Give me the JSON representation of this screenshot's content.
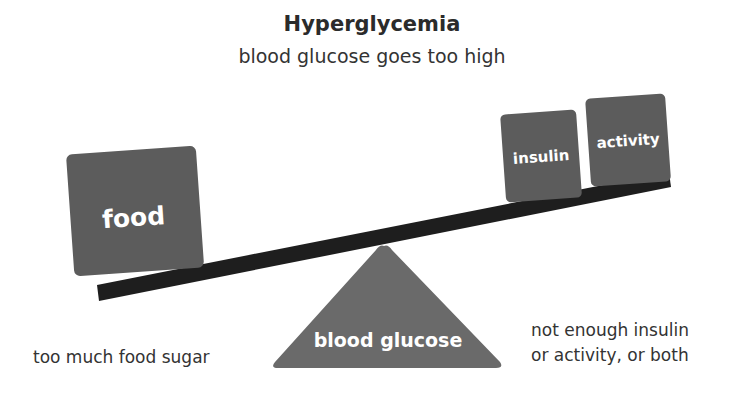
{
  "header": {
    "title": "Hyperglycemia",
    "subtitle": "blood glucose goes too high"
  },
  "scale": {
    "left_box": "food",
    "right_boxes": [
      "insulin",
      "activity"
    ],
    "fulcrum_label": "blood glucose"
  },
  "labels": {
    "left": "too much food sugar",
    "right_line1": "not enough insulin",
    "right_line2": "or activity, or both"
  },
  "colors": {
    "box_fill": "#5c5c5c",
    "beam": "#1e1e1e",
    "fulcrum": "#6a6a6a",
    "text_on_shape": "#ffffff"
  }
}
